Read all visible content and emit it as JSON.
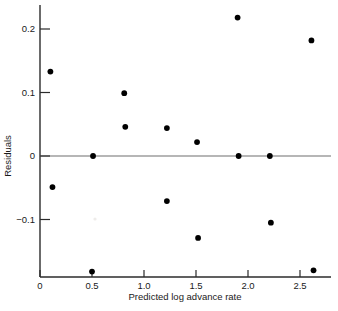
{
  "chart_data": {
    "type": "scatter",
    "title": "",
    "xlabel": "Predicted log advance rate",
    "ylabel": "Residuals",
    "xlim": [
      -0.08,
      2.78
    ],
    "ylim": [
      -0.2,
      0.235
    ],
    "grid": false,
    "legend": null,
    "xticks": [
      0,
      0.5,
      1.0,
      1.5,
      2.0,
      2.5
    ],
    "xticklabels": [
      "0",
      "0.5",
      "1.0",
      "1.5",
      "2.0",
      "2.5"
    ],
    "yticks": [
      0.2,
      0.1,
      0,
      -0.1
    ],
    "yticklabels": [
      "0.2",
      "0.1",
      "0",
      "−0.1"
    ],
    "reference_lines": [
      {
        "axis": "y",
        "value": 0,
        "color": "#6f6f6f"
      }
    ],
    "marker": {
      "shape": "circle",
      "color": "#000000",
      "size": 4.2
    },
    "points": [
      {
        "x": 0.1,
        "y": 0.133
      },
      {
        "x": 0.12,
        "y": -0.049
      },
      {
        "x": 0.5,
        "y": -0.182
      },
      {
        "x": 0.51,
        "y": 0.0
      },
      {
        "x": 0.81,
        "y": 0.099
      },
      {
        "x": 0.82,
        "y": 0.046
      },
      {
        "x": 1.22,
        "y": 0.044
      },
      {
        "x": 1.22,
        "y": -0.071
      },
      {
        "x": 1.51,
        "y": 0.022
      },
      {
        "x": 1.52,
        "y": -0.129
      },
      {
        "x": 1.9,
        "y": 0.218
      },
      {
        "x": 1.91,
        "y": 0.0
      },
      {
        "x": 2.21,
        "y": 0.0
      },
      {
        "x": 2.22,
        "y": -0.105
      },
      {
        "x": 2.61,
        "y": 0.182
      },
      {
        "x": 2.63,
        "y": -0.18
      }
    ]
  }
}
